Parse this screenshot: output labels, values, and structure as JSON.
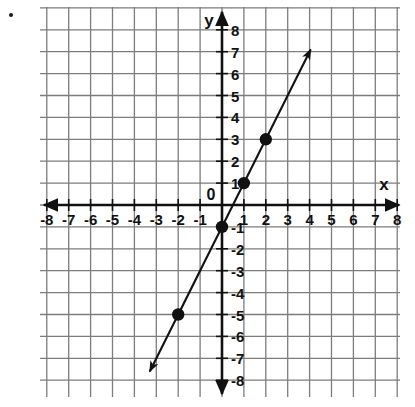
{
  "figure": {
    "bullet_marker": "bullet-dot",
    "background_color": "#ffffff"
  },
  "chart_data": {
    "type": "line",
    "title": "",
    "subtitle": "",
    "xlabel": "x",
    "ylabel": "y",
    "origin_label": "0",
    "xlim": [
      -8.5,
      8.5
    ],
    "ylim": [
      -8.5,
      8.5
    ],
    "xticks": [
      -8,
      -7,
      -6,
      -5,
      -4,
      -3,
      -2,
      -1,
      1,
      2,
      3,
      4,
      5,
      6,
      7,
      8
    ],
    "yticks": [
      8,
      7,
      6,
      5,
      4,
      3,
      2,
      1,
      -1,
      -2,
      -3,
      -4,
      -5,
      -6,
      -7,
      -8
    ],
    "xtick_labels": [
      "-8",
      "-7",
      "-6",
      "-5",
      "-4",
      "-3",
      "-2",
      "-1",
      "1",
      "2",
      "3",
      "4",
      "5",
      "6",
      "7",
      "8"
    ],
    "ytick_labels": [
      "8",
      "7",
      "6",
      "5",
      "4",
      "3",
      "2",
      "1",
      "-1",
      "-2",
      "-3",
      "-4",
      "-5",
      "-6",
      "-7",
      "-8"
    ],
    "grid": true,
    "grid_spacing_units": 1,
    "grid_color": "#7d7d7d",
    "axis_color": "#111111",
    "legend": false,
    "series": [
      {
        "name": "line",
        "equation": "y = 2x - 1",
        "slope": 2,
        "intercept": -1,
        "color": "#111111",
        "arrow_start": [
          -3.3,
          -7.6
        ],
        "arrow_end": [
          4.05,
          7.1
        ],
        "points": [
          {
            "x": -2,
            "y": -5
          },
          {
            "x": 0,
            "y": -1
          },
          {
            "x": 1,
            "y": 1
          },
          {
            "x": 2,
            "y": 3
          }
        ]
      }
    ],
    "marked_points": [
      {
        "label": "(-2, -5)",
        "x": -2,
        "y": -5
      },
      {
        "label": "(0, -1)",
        "x": 0,
        "y": -1
      },
      {
        "label": "(1, 1)",
        "x": 1,
        "y": 1
      },
      {
        "label": "(2, 3)",
        "x": 2,
        "y": 3
      }
    ]
  }
}
